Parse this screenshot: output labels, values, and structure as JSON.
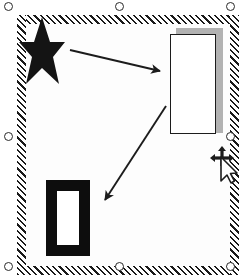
{
  "app": {
    "view": "drawing-canvas",
    "background_color": "#ffffff",
    "canvas_color": "#fdfdfd"
  },
  "selection": {
    "state": "selected",
    "frame_style": "diagonal-hatch",
    "hatch_color": "#1a1a1a",
    "hatch_background": "#ffffff",
    "handle_count": 8,
    "handle_shape": "circle",
    "handle_fill": "#ffffff",
    "handle_stroke": "#2a2a2a",
    "handles": [
      {
        "name": "handle-top-left",
        "position": "top-left",
        "x": 4,
        "y": 2
      },
      {
        "name": "handle-top-center",
        "position": "top-center",
        "x": 115,
        "y": 2
      },
      {
        "name": "handle-top-right",
        "position": "top-right",
        "x": 226,
        "y": 2
      },
      {
        "name": "handle-middle-left",
        "position": "middle-left",
        "x": 4,
        "y": 132
      },
      {
        "name": "handle-middle-right",
        "position": "middle-right",
        "x": 226,
        "y": 132
      },
      {
        "name": "handle-bottom-left",
        "position": "bottom-left",
        "x": 4,
        "y": 262
      },
      {
        "name": "handle-bottom-center",
        "position": "bottom-center",
        "x": 115,
        "y": 262
      },
      {
        "name": "handle-bottom-right",
        "position": "bottom-right",
        "x": 226,
        "y": 262
      }
    ]
  },
  "shapes": [
    {
      "name": "star",
      "type": "star-5-point",
      "fill": "#141414",
      "stroke": "none",
      "x": 18,
      "y": 16,
      "width": 48,
      "height": 70
    },
    {
      "name": "rectangle-with-shadow",
      "type": "rectangle",
      "fill": "#ffffff",
      "stroke": "#1c1c1c",
      "shadow_color": "#b2b2b2",
      "shadow_offset_x": 6,
      "shadow_offset_y": -6,
      "x": 170,
      "y": 34,
      "width": 46,
      "height": 100
    },
    {
      "name": "thick-bordered-rectangle",
      "type": "rectangle",
      "fill": "#ffffff",
      "stroke": "#0d0d0d",
      "stroke_width": 11,
      "x": 46,
      "y": 180,
      "width": 44,
      "height": 76
    }
  ],
  "connectors": [
    {
      "name": "arrow-star-to-rectangle",
      "type": "arrow",
      "color": "#1c1c1c",
      "from": {
        "x": 70,
        "y": 50
      },
      "to": {
        "x": 163,
        "y": 72
      },
      "arrowhead": "end"
    },
    {
      "name": "arrow-rectangle-to-thick-rectangle",
      "type": "arrow",
      "color": "#1c1c1c",
      "from": {
        "x": 166,
        "y": 106
      },
      "to": {
        "x": 102,
        "y": 204
      },
      "arrowhead": "end"
    }
  ],
  "cursor": {
    "name": "move-cursor",
    "type": "move-with-pointer",
    "x": 209,
    "y": 146,
    "color": "#1c1c1c"
  }
}
